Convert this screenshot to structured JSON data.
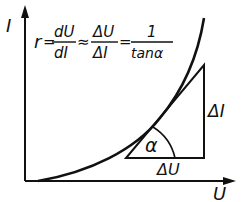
{
  "diagram": {
    "type": "current-voltage characteristic with tangent triangle",
    "axes": {
      "y_label": "I",
      "x_label": "U"
    },
    "formula": {
      "lhs": "r",
      "eq": "=",
      "frac1": {
        "num": "dU",
        "den": "dI"
      },
      "approx": "≈",
      "frac2": {
        "num": "ΔU",
        "den": "ΔI"
      },
      "eq2": "=",
      "frac3": {
        "num": "1",
        "den": "tanα"
      }
    },
    "triangle": {
      "angle_label": "α",
      "vertical_label": "ΔI",
      "horizontal_label": "ΔU"
    },
    "colors": {
      "ink": "#111111",
      "background": "#ffffff"
    }
  }
}
